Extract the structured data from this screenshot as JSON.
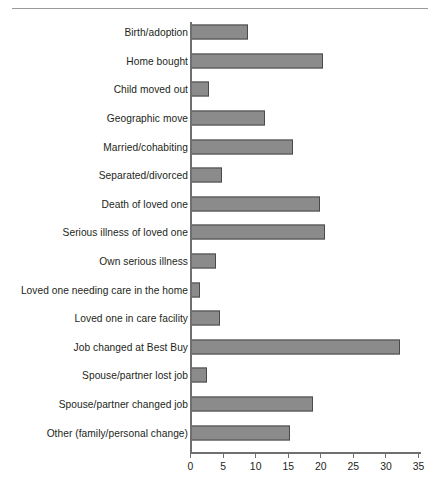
{
  "figure": {
    "has_top_rule": true,
    "background_color": "#ffffff",
    "bar_fill_color": "#8b8b8b",
    "bar_border_color": "#4a4a4a",
    "axis_color": "#6f6f6f",
    "text_color": "#231f20"
  },
  "chart_data": {
    "type": "bar",
    "orientation": "horizontal",
    "title": "",
    "xlabel": "",
    "ylabel": "",
    "xlim": [
      0,
      35
    ],
    "grid": false,
    "legend": null,
    "xticks": [
      0,
      5,
      10,
      15,
      20,
      25,
      30,
      35
    ],
    "xtick_labels": [
      "0",
      "5",
      "10",
      "15",
      "20",
      "25",
      "30",
      "35"
    ],
    "categories": [
      "Birth/adoption",
      "Home bought",
      "Child moved out",
      "Geographic move",
      "Married/cohabiting",
      "Separated/divorced",
      "Death of loved one",
      "Serious illness of loved one",
      "Own serious illness",
      "Loved one needing care in the home",
      "Loved one in care facility",
      "Job changed at Best Buy",
      "Spouse/partner lost job",
      "Spouse/partner changed job",
      "Other (family/personal change)"
    ],
    "values": [
      8.7,
      20.3,
      2.8,
      11.4,
      15.6,
      4.7,
      19.8,
      20.6,
      3.8,
      1.4,
      4.4,
      32.1,
      2.5,
      18.8,
      15.2
    ]
  }
}
